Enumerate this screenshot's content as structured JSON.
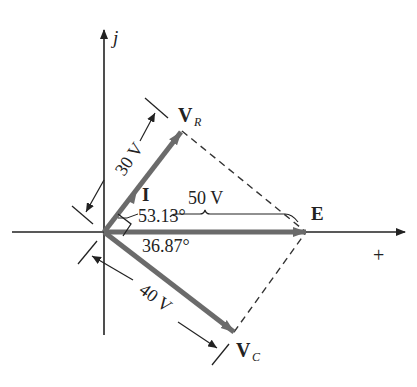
{
  "diagram": {
    "axes": {
      "imaginary_label": "j",
      "real_label": "+"
    },
    "phasors": {
      "vr": {
        "label": "V",
        "subscript": "R",
        "magnitude_label": "30 V"
      },
      "e": {
        "label": "E",
        "magnitude_label": "50 V"
      },
      "vc": {
        "label": "V",
        "subscript": "C",
        "magnitude_label": "40 V"
      },
      "i": {
        "label": "I"
      }
    },
    "angles": {
      "upper": "53.13°",
      "lower": "36.87°"
    },
    "colors": {
      "phasor": "#6b6b6b",
      "axis": "#222222",
      "dashed": "#333333"
    }
  }
}
